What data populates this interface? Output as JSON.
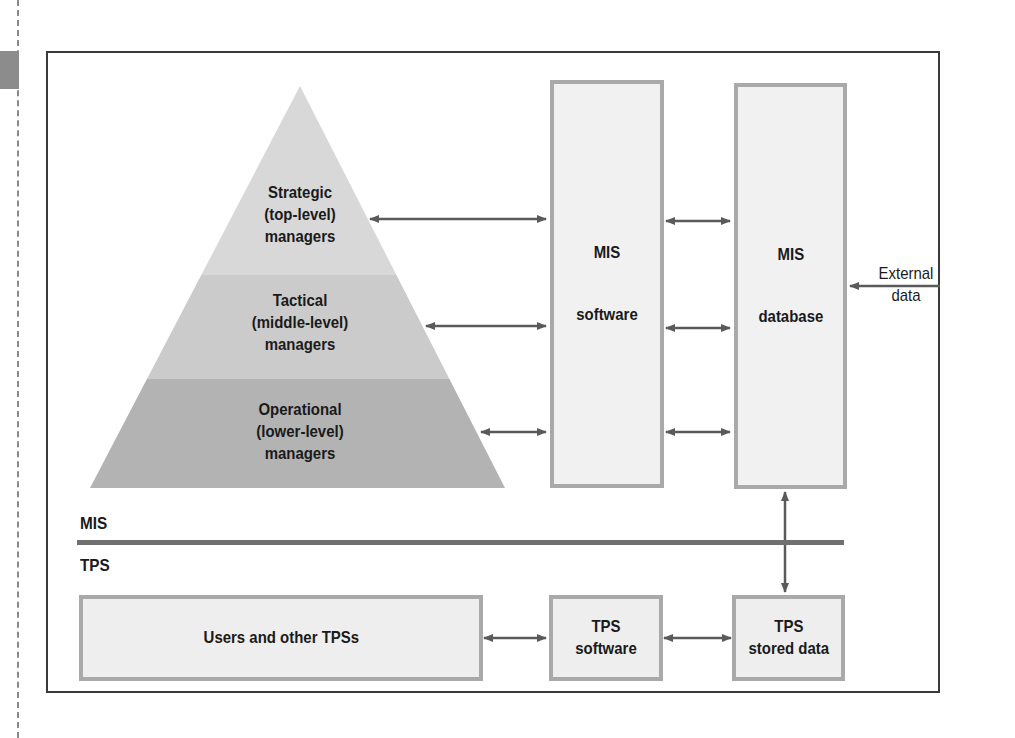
{
  "pyramid": {
    "levels": [
      {
        "line1": "Strategic",
        "line2": "(top-level)",
        "line3": "managers",
        "color": "#d8d8d8"
      },
      {
        "line1": "Tactical",
        "line2": "(middle-level)",
        "line3": "managers",
        "color": "#cbcbcb"
      },
      {
        "line1": "Operational",
        "line2": "(lower-level)",
        "line3": "managers",
        "color": "#b3b3b3"
      }
    ]
  },
  "mis_software": {
    "line1": "MIS",
    "line2": "software"
  },
  "mis_database": {
    "line1": "MIS",
    "line2": "database"
  },
  "external_data": {
    "line1": "External",
    "line2": "data"
  },
  "layers": {
    "top": "MIS",
    "bottom": "TPS"
  },
  "tps": {
    "users": "Users and other TPSs",
    "software": "TPS\nsoftware",
    "stored_data": "TPS\nstored data"
  },
  "colors": {
    "arrow": "#5a5a5a",
    "box_border": "#a9a9a9",
    "separator": "#707070"
  }
}
